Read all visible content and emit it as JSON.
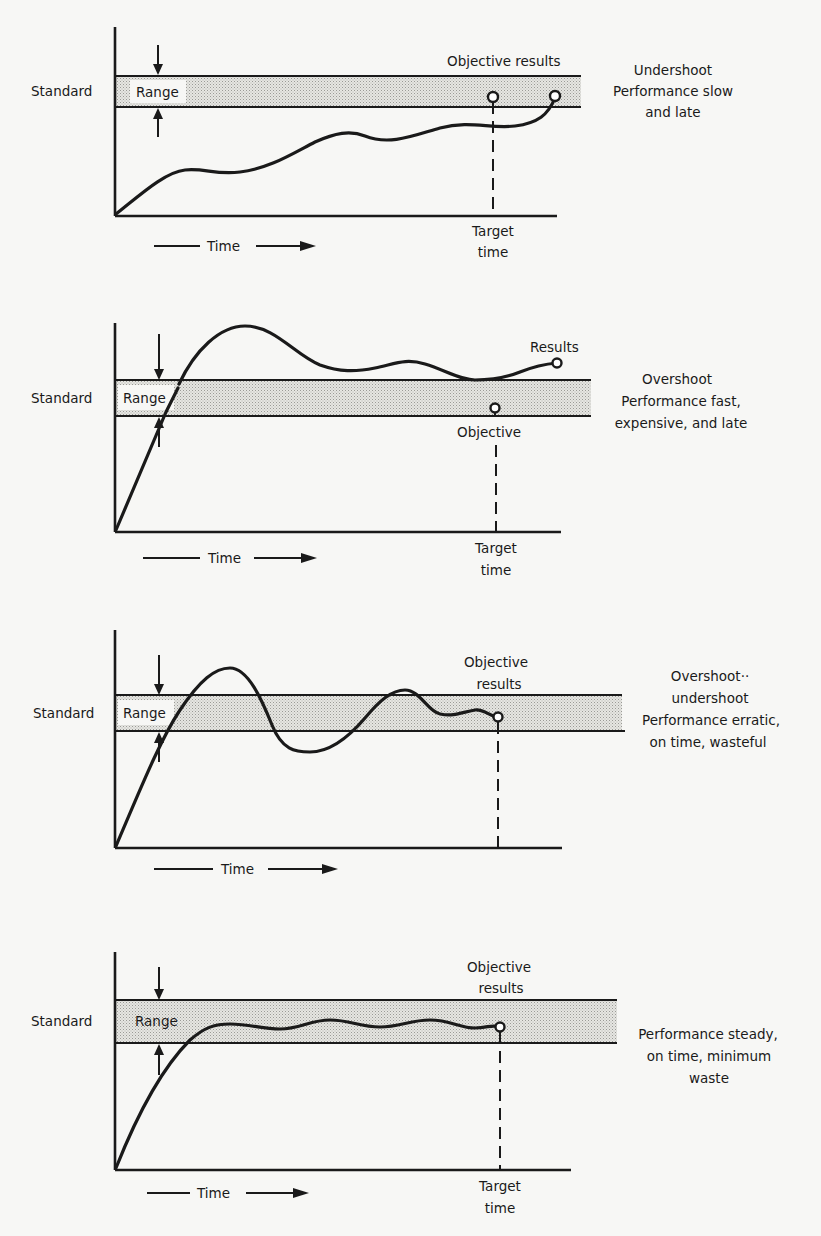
{
  "figure": {
    "colors": {
      "ink": "#1a1a1a",
      "paper": "#f7f7f5",
      "band_fill": "#d4d4d0"
    },
    "common_labels": {
      "standard": "Standard",
      "range": "Range",
      "time": "Time"
    },
    "panels": [
      {
        "id": "undershoot",
        "point_label": [
          "Objective results"
        ],
        "description": [
          "Undershoot",
          "Performance slow",
          "and late"
        ],
        "target_label": [
          "Target",
          "time"
        ]
      },
      {
        "id": "overshoot",
        "results_label": "Results",
        "objective_label": "Objective",
        "description": [
          "Overshoot",
          "Performance fast,",
          "expensive, and late"
        ],
        "target_label": [
          "Target",
          "time"
        ]
      },
      {
        "id": "overshoot-undershoot",
        "point_label": [
          "Objective",
          "results"
        ],
        "description": [
          "Overshoot··",
          "undershoot",
          "Performance erratic,",
          "on time, wasteful"
        ],
        "target_label": []
      },
      {
        "id": "steady",
        "point_label": [
          "Objective",
          "results"
        ],
        "description": [
          "Performance steady,",
          "on time, minimum",
          "waste"
        ],
        "target_label": [
          "Target",
          "time"
        ]
      }
    ]
  }
}
